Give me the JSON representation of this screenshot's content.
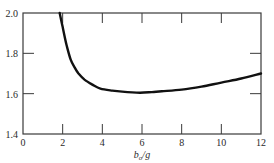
{
  "chart_data": {
    "type": "line",
    "title": "",
    "xlabel": "b₀/g",
    "xlabel_main": "b",
    "xlabel_sub": "o",
    "xlabel_rest": "/g",
    "ylabel": "",
    "xlim": [
      0,
      12
    ],
    "ylim": [
      1.4,
      2.0
    ],
    "x_ticks": [
      0,
      2,
      4,
      6,
      8,
      10,
      12
    ],
    "x_tick_labels": [
      "0",
      "2",
      "4",
      "6",
      "8",
      "10",
      "12"
    ],
    "y_ticks": [
      1.4,
      1.6,
      1.8,
      2.0
    ],
    "y_tick_labels": [
      "1.4",
      "1.6",
      "1.8",
      "2.0"
    ],
    "grid": false,
    "legend": null,
    "series": [
      {
        "name": "curve",
        "color": "#111111",
        "x": [
          1.85,
          2.0,
          2.2,
          2.4,
          2.6,
          2.8,
          3.1,
          3.5,
          3.9,
          4.5,
          5.0,
          5.9,
          6.5,
          7.0,
          8.0,
          9.0,
          10.0,
          11.0,
          12.0
        ],
        "y": [
          2.0,
          1.93,
          1.84,
          1.77,
          1.73,
          1.7,
          1.67,
          1.645,
          1.625,
          1.615,
          1.61,
          1.605,
          1.608,
          1.612,
          1.62,
          1.635,
          1.655,
          1.675,
          1.7
        ]
      }
    ]
  }
}
